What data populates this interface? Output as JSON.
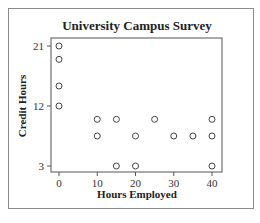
{
  "chart_data": {
    "type": "scatter",
    "title": "University Campus Survey",
    "xlabel": "Hours Employed",
    "ylabel": "Credit Hours",
    "xlim": [
      0,
      40
    ],
    "ylim": [
      3,
      21
    ],
    "xticks": [
      0,
      10,
      20,
      30,
      40
    ],
    "yticks": [
      3,
      12,
      21
    ],
    "grid": false,
    "legend": null,
    "points": [
      {
        "x": 0,
        "y": 21
      },
      {
        "x": 0,
        "y": 19
      },
      {
        "x": 0,
        "y": 15
      },
      {
        "x": 0,
        "y": 12
      },
      {
        "x": 10,
        "y": 10
      },
      {
        "x": 15,
        "y": 10
      },
      {
        "x": 25,
        "y": 10
      },
      {
        "x": 40,
        "y": 10
      },
      {
        "x": 10,
        "y": 7.5
      },
      {
        "x": 20,
        "y": 7.5
      },
      {
        "x": 30,
        "y": 7.5
      },
      {
        "x": 35,
        "y": 7.5
      },
      {
        "x": 40,
        "y": 7.5
      },
      {
        "x": 15,
        "y": 3
      },
      {
        "x": 20,
        "y": 3
      },
      {
        "x": 40,
        "y": 3
      }
    ]
  }
}
